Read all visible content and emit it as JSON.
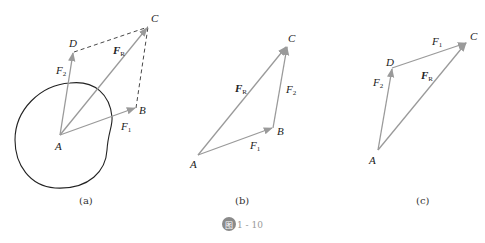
{
  "figure": {
    "number": "1 - 10",
    "badge": "图",
    "colors": {
      "vector": "#9a9a9a",
      "outline": "#222222",
      "text": "#222222",
      "badge": "#8a8a8a"
    }
  },
  "panels": [
    {
      "caption": "(a)",
      "points": {
        "A": "A",
        "B": "B",
        "C": "C",
        "D": "D"
      },
      "vectors": {
        "F1": "F",
        "F1_sub": "1",
        "F2": "F",
        "F2_sub": "2",
        "FR": "F",
        "FR_sub": "R"
      }
    },
    {
      "caption": "(b)",
      "points": {
        "A": "A",
        "B": "B",
        "C": "C"
      },
      "vectors": {
        "F1": "F",
        "F1_sub": "1",
        "F2": "F",
        "F2_sub": "2",
        "FR": "F",
        "FR_sub": "R"
      }
    },
    {
      "caption": "(c)",
      "points": {
        "A": "A",
        "C": "C",
        "D": "D"
      },
      "vectors": {
        "F1": "F",
        "F1_sub": "1",
        "F2": "F",
        "F2_sub": "2",
        "FR": "F",
        "FR_sub": "R"
      }
    }
  ]
}
